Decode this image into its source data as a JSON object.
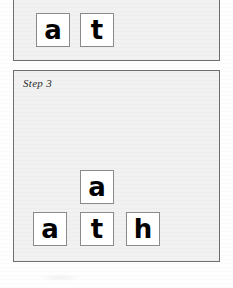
{
  "document": {
    "title": "Letter Tile Word Building Steps",
    "background_color": "#fdfdfd",
    "panel_fill_color": "#f1f1f1",
    "panel_border_color": "#6e6e6e",
    "tile_fill_color": "#ffffff",
    "tile_border_color": "#8a8a8a",
    "letter_color": "#000000"
  },
  "panels": [
    {
      "id": "panel-previous-step",
      "label": "",
      "label_visible": false,
      "cropped_at_top": true,
      "rows": [
        {
          "id": "row-main",
          "tiles": [
            {
              "letter": "a"
            },
            {
              "letter": "t"
            }
          ]
        }
      ],
      "word_shown": "at"
    },
    {
      "id": "panel-step-3",
      "label": "Step 3",
      "label_visible": true,
      "cropped_at_top": false,
      "rows": [
        {
          "id": "row-upper",
          "tiles": [
            {
              "letter": "a"
            }
          ]
        },
        {
          "id": "row-lower",
          "tiles": [
            {
              "letter": "a"
            },
            {
              "letter": "t"
            },
            {
              "letter": "h"
            }
          ]
        }
      ],
      "word_shown": "ath"
    }
  ]
}
